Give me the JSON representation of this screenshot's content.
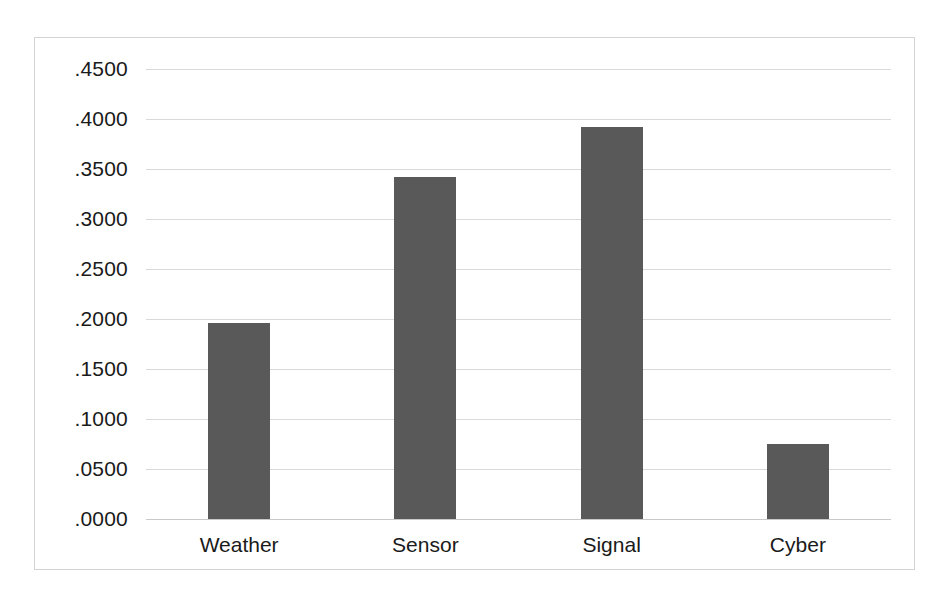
{
  "chart_data": {
    "type": "bar",
    "title": "",
    "subtitle": "",
    "xlabel": "",
    "ylabel": "",
    "categories": [
      "Weather",
      "Sensor",
      "Signal",
      "Cyber"
    ],
    "values": [
      0.196,
      0.342,
      0.392,
      0.075
    ],
    "ylim": [
      0.0,
      0.45
    ],
    "ytick_step": 0.05,
    "ytick_labels": [
      ".4500",
      ".4000",
      ".3500",
      ".3000",
      ".2500",
      ".2000",
      ".1500",
      ".1000",
      ".0500",
      ".0000"
    ],
    "ytick_values": [
      0.45,
      0.4,
      0.35,
      0.3,
      0.25,
      0.2,
      0.15,
      0.1,
      0.05,
      0.0
    ],
    "grid": true,
    "grid_axis": "y",
    "legend": false,
    "legend_position": "none",
    "bar_color": "#595959",
    "grid_color": "#d9d9d9",
    "border_color": "#d4d4d4",
    "background_color": "#ffffff"
  }
}
